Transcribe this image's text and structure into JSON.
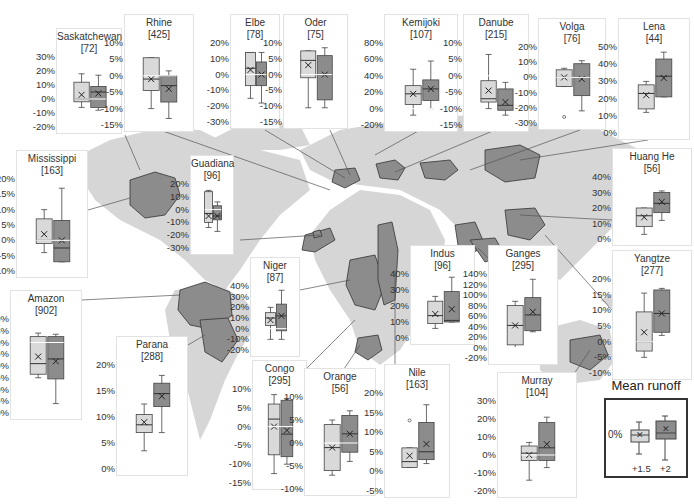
{
  "figure": {
    "legend": {
      "title": "Mean runoff",
      "zero_label": "0%",
      "categories": [
        "+1.5",
        "+2"
      ],
      "colors": {
        "+1.5": "#d9d9d9",
        "+2": "#8c8c8c"
      }
    }
  },
  "chart_data": {
    "type": "box",
    "series_names": [
      "+1.5",
      "+2"
    ],
    "panels": [
      {
        "name": "Saskatchewan",
        "count": "[72]",
        "x": 56,
        "y": 28,
        "w": 66,
        "h": 106,
        "ylim": [
          -20,
          30
        ],
        "ticks": [
          "30%",
          "20%",
          "10%",
          "0%",
          "-10%",
          "-20%"
        ],
        "boxes": [
          {
            "lo": -6,
            "q1": -2,
            "med": 0,
            "q3": 12,
            "hi": 18,
            "mean": 3
          },
          {
            "lo": -8,
            "q1": -6,
            "med": 5,
            "q3": 9,
            "hi": 17,
            "mean": 4
          }
        ]
      },
      {
        "name": "Rhine",
        "count": "[425]",
        "x": 124,
        "y": 14,
        "w": 70,
        "h": 118,
        "ylim": [
          -15,
          10
        ],
        "ticks": [
          "10%",
          "5%",
          "0%",
          "-5%",
          "-10%",
          "-15%"
        ],
        "boxes": [
          {
            "lo": -10,
            "q1": -4.5,
            "med": -1,
            "q3": 5.5,
            "hi": 5.5,
            "mean": -1
          },
          {
            "lo": -13,
            "q1": -8,
            "med": -3,
            "q3": 0,
            "hi": 1.5,
            "mean": -4
          }
        ]
      },
      {
        "name": "Elbe",
        "count": "[78]",
        "x": 230,
        "y": 14,
        "w": 50,
        "h": 115,
        "ylim": [
          -30,
          20
        ],
        "ticks": [
          "20%",
          "10%",
          "0%",
          "-10%",
          "-20%",
          "-30%"
        ],
        "boxes": [
          {
            "lo": -15,
            "q1": -7,
            "med": 4,
            "q3": 14,
            "hi": 14,
            "mean": 3
          },
          {
            "lo": -18,
            "q1": -7,
            "med": 0,
            "q3": 8,
            "hi": 14,
            "mean": 0
          }
        ]
      },
      {
        "name": "Oder",
        "count": "[75]",
        "x": 283,
        "y": 14,
        "w": 65,
        "h": 115,
        "ylim": [
          -15,
          10
        ],
        "ticks": [
          "10%",
          "5%",
          "0%",
          "-5%",
          "-10%",
          "-15%"
        ],
        "boxes": [
          {
            "lo": -10.5,
            "q1": -1,
            "med": 4.5,
            "q3": 7.5,
            "hi": 7.5,
            "mean": 3
          },
          {
            "lo": -10.5,
            "q1": -8,
            "med": 0,
            "q3": 6,
            "hi": 8.5,
            "mean": 0
          }
        ]
      },
      {
        "name": "Kemijoki",
        "count": "[107]",
        "x": 384,
        "y": 14,
        "w": 74,
        "h": 118,
        "ylim": [
          -20,
          80
        ],
        "ticks": [
          "80%",
          "60%",
          "40%",
          "20%",
          "0%",
          "-20%"
        ],
        "boxes": [
          {
            "lo": -8,
            "q1": 5,
            "med": 18,
            "q3": 28,
            "hi": 48,
            "mean": 18
          },
          {
            "lo": 0,
            "q1": 10,
            "med": 24,
            "q3": 35,
            "hi": 58,
            "mean": 24
          }
        ]
      },
      {
        "name": "Danube",
        "count": "[215]",
        "x": 463,
        "y": 14,
        "w": 66,
        "h": 118,
        "ylim": [
          -15,
          10
        ],
        "ticks": [
          "10%",
          "5%",
          "0%",
          "-5%",
          "-10%",
          "-15%"
        ],
        "boxes": [
          {
            "lo": -10,
            "q1": -8,
            "med": -7,
            "q3": -1.5,
            "hi": 6.5,
            "mean": -4.5
          },
          {
            "lo": -12,
            "q1": -10.5,
            "med": -9,
            "q3": -4,
            "hi": -2,
            "mean": -8
          }
        ]
      },
      {
        "name": "Volga",
        "count": "[76]",
        "x": 538,
        "y": 18,
        "w": 68,
        "h": 112,
        "ylim": [
          -30,
          20
        ],
        "ticks": [
          "20%",
          "10%",
          "0%",
          "-10%",
          "-20%",
          "-30%"
        ],
        "boxes": [
          {
            "lo": -6,
            "q1": -6,
            "med": 0,
            "q3": 5,
            "hi": 6,
            "mean": 0,
            "outliers": [
              -26
            ]
          },
          {
            "lo": -22,
            "q1": -12,
            "med": 0,
            "q3": 9,
            "hi": 11,
            "mean": -1
          }
        ]
      },
      {
        "name": "Lena",
        "count": "[44]",
        "x": 618,
        "y": 18,
        "w": 72,
        "h": 122,
        "ylim": [
          0,
          50
        ],
        "ticks": [
          "50%",
          "40%",
          "30%",
          "20%",
          "10%",
          "0%"
        ],
        "boxes": [
          {
            "lo": 12,
            "q1": 14,
            "med": 23,
            "q3": 28,
            "hi": 30,
            "mean": 22
          },
          {
            "lo": 21,
            "q1": 21,
            "med": 33,
            "q3": 43,
            "hi": 47,
            "mean": 32
          }
        ]
      },
      {
        "name": "Mississippi",
        "count": "[163]",
        "x": 16,
        "y": 150,
        "w": 72,
        "h": 128,
        "ylim": [
          -10,
          20
        ],
        "ticks": [
          "20%",
          "15%",
          "10%",
          "5%",
          "0%",
          "-5%",
          "-10%"
        ],
        "boxes": [
          {
            "lo": -4,
            "q1": -1,
            "med": 0,
            "q3": 7,
            "hi": 10,
            "mean": 2
          },
          {
            "lo": -7,
            "q1": -7,
            "med": -2.5,
            "q3": 6.5,
            "hi": 17,
            "mean": 0
          }
        ]
      },
      {
        "name": "Guadiana",
        "count": "[96]",
        "x": 190,
        "y": 155,
        "w": 44,
        "h": 100,
        "ylim": [
          -30,
          20
        ],
        "ticks": [
          "20%",
          "10%",
          "0%",
          "-10%",
          "-20%",
          "-30%"
        ],
        "boxes": [
          {
            "lo": -14,
            "q1": -10,
            "med": -3,
            "q3": 14,
            "hi": 15,
            "mean": -5
          },
          {
            "lo": -17,
            "q1": -8,
            "med": -5,
            "q3": 3,
            "hi": 6,
            "mean": -5
          }
        ]
      },
      {
        "name": "Huang He",
        "count": "[56]",
        "x": 612,
        "y": 148,
        "w": 80,
        "h": 98,
        "ylim": [
          0,
          40
        ],
        "ticks": [
          "40%",
          "30%",
          "20%",
          "10%",
          "0%"
        ],
        "boxes": [
          {
            "lo": 3,
            "q1": 8,
            "med": 15,
            "q3": 20,
            "hi": 20,
            "mean": 14
          },
          {
            "lo": 12,
            "q1": 17,
            "med": 23,
            "q3": 30,
            "hi": 31,
            "mean": 24
          }
        ]
      },
      {
        "name": "Yangtze",
        "count": "[277]",
        "x": 612,
        "y": 250,
        "w": 80,
        "h": 130,
        "ylim": [
          -10,
          20
        ],
        "ticks": [
          "20%",
          "15%",
          "10%",
          "5%",
          "0%",
          "-5%",
          "-10%"
        ],
        "boxes": [
          {
            "lo": -5,
            "q1": -3,
            "med": 0,
            "q3": 9.5,
            "hi": 15.5,
            "mean": 3
          },
          {
            "lo": 2,
            "q1": 3,
            "med": 9,
            "q3": 16.5,
            "hi": 17,
            "mean": 9
          }
        ]
      },
      {
        "name": "Amazon",
        "count": "[902]",
        "x": 10,
        "y": 290,
        "w": 72,
        "h": 130,
        "ylim": [
          -30,
          10
        ],
        "ticks": [
          "10%",
          "5%",
          "0%",
          "-5%",
          "-10%",
          "-15%",
          "-20%",
          "-25%",
          "-30%"
        ],
        "boxes": [
          {
            "lo": -15,
            "q1": -13.5,
            "med": -9,
            "q3": 2.5,
            "hi": 4,
            "mean": -6
          },
          {
            "lo": -26,
            "q1": -15.5,
            "med": -7,
            "q3": 2.5,
            "hi": 3.5,
            "mean": -8
          }
        ]
      },
      {
        "name": "Parana",
        "count": "[288]",
        "x": 116,
        "y": 336,
        "w": 72,
        "h": 140,
        "ylim": [
          0,
          20
        ],
        "ticks": [
          "20%",
          "15%",
          "10%",
          "5%",
          "0%"
        ],
        "boxes": [
          {
            "lo": 3.5,
            "q1": 7,
            "med": 8.5,
            "q3": 10.5,
            "hi": 12.5,
            "mean": 9
          },
          {
            "lo": 7,
            "q1": 12,
            "med": 14.5,
            "q3": 16.5,
            "hi": 18,
            "mean": 14
          }
        ]
      },
      {
        "name": "Niger",
        "count": "[87]",
        "x": 250,
        "y": 257,
        "w": 50,
        "h": 100,
        "ylim": [
          -20,
          40
        ],
        "ticks": [
          "40%",
          "30%",
          "20%",
          "10%",
          "0%",
          "-10%",
          "-20%"
        ],
        "boxes": [
          {
            "lo": -10,
            "q1": 3,
            "med": 10,
            "q3": 15,
            "hi": 20,
            "mean": 8
          },
          {
            "lo": -10,
            "q1": -2,
            "med": 12,
            "q3": 23,
            "hi": 36,
            "mean": 12
          }
        ]
      },
      {
        "name": "Congo",
        "count": "[295]",
        "x": 252,
        "y": 360,
        "w": 55,
        "h": 130,
        "ylim": [
          -15,
          10
        ],
        "ticks": [
          "10%",
          "5%",
          "0%",
          "-5%",
          "-10%",
          "-15%"
        ],
        "boxes": [
          {
            "lo": -12.5,
            "q1": -7.5,
            "med": 2,
            "q3": 6,
            "hi": 8.5,
            "mean": 0
          },
          {
            "lo": -10,
            "q1": -8,
            "med": -2,
            "q3": 7,
            "hi": 7.5,
            "mean": -1
          }
        ]
      },
      {
        "name": "Orange",
        "count": "[56]",
        "x": 304,
        "y": 368,
        "w": 72,
        "h": 128,
        "ylim": [
          -10,
          10
        ],
        "ticks": [
          "10%",
          "5%",
          "0%",
          "-5%",
          "-10%"
        ],
        "boxes": [
          {
            "lo": -7,
            "q1": -6,
            "med": -1,
            "q3": 4,
            "hi": 5,
            "mean": -1
          },
          {
            "lo": -4,
            "q1": -2,
            "med": 2,
            "q3": 6,
            "hi": 7,
            "mean": 2
          }
        ]
      },
      {
        "name": "Nile",
        "count": "[163]",
        "x": 384,
        "y": 364,
        "w": 66,
        "h": 134,
        "ylim": [
          -5,
          20
        ],
        "ticks": [
          "20%",
          "15%",
          "10%",
          "5%",
          "0%",
          "-5%"
        ],
        "boxes": [
          {
            "lo": 1,
            "q1": 1,
            "med": 2.5,
            "q3": 6,
            "hi": 6,
            "mean": 4,
            "outliers": [
              13
            ]
          },
          {
            "lo": 2,
            "q1": 3,
            "med": 5,
            "q3": 12.5,
            "hi": 17,
            "mean": 7
          }
        ]
      },
      {
        "name": "Indus",
        "count": "[96]",
        "x": 410,
        "y": 245,
        "w": 65,
        "h": 100,
        "ylim": [
          0,
          40
        ],
        "ticks": [
          "40%",
          "30%",
          "20%",
          "10%",
          "0%"
        ],
        "boxes": [
          {
            "lo": 6,
            "q1": 9,
            "med": 14,
            "q3": 23,
            "hi": 26,
            "mean": 15
          },
          {
            "lo": 10,
            "q1": 10,
            "med": 11,
            "q3": 29,
            "hi": 38,
            "mean": 18
          }
        ]
      },
      {
        "name": "Ganges",
        "count": "[295]",
        "x": 488,
        "y": 245,
        "w": 70,
        "h": 120,
        "ylim": [
          -20,
          140
        ],
        "ticks": [
          "140%",
          "120%",
          "100%",
          "80%",
          "60%",
          "40%",
          "20%",
          "0%",
          "-20%"
        ],
        "boxes": [
          {
            "lo": 0,
            "q1": 5,
            "med": 42,
            "q3": 80,
            "hi": 88,
            "mean": 42
          },
          {
            "lo": 30,
            "q1": 32,
            "med": 62,
            "q3": 95,
            "hi": 130,
            "mean": 68
          }
        ]
      },
      {
        "name": "Murray",
        "count": "[104]",
        "x": 497,
        "y": 372,
        "w": 80,
        "h": 126,
        "ylim": [
          -20,
          30
        ],
        "ticks": [
          "30%",
          "20%",
          "10%",
          "0%",
          "-10%",
          "-20%"
        ],
        "boxes": [
          {
            "lo": -14,
            "q1": -3,
            "med": 1,
            "q3": 5,
            "hi": 7,
            "mean": 0
          },
          {
            "lo": -7,
            "q1": -3,
            "med": 4,
            "q3": 18,
            "hi": 21,
            "mean": 6
          }
        ]
      }
    ]
  }
}
